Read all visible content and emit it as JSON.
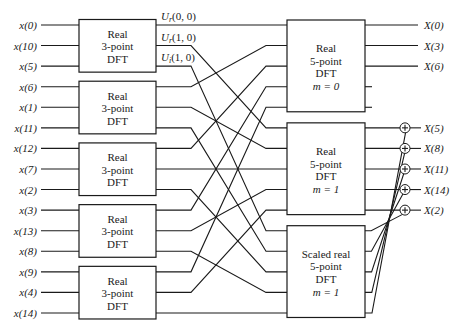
{
  "diagram": {
    "inputs": [
      "x(0)",
      "x(10)",
      "x(5)",
      "x(6)",
      "x(1)",
      "x(11)",
      "x(12)",
      "x(7)",
      "x(2)",
      "x(3)",
      "x(13)",
      "x(8)",
      "x(9)",
      "x(4)",
      "x(14)"
    ],
    "three_point_blocks": [
      {
        "lines": [
          "Real",
          "3-point",
          "DFT"
        ]
      },
      {
        "lines": [
          "Real",
          "3-point",
          "DFT"
        ]
      },
      {
        "lines": [
          "Real",
          "3-point",
          "DFT"
        ]
      },
      {
        "lines": [
          "Real",
          "3-point",
          "DFT"
        ]
      },
      {
        "lines": [
          "Real",
          "3-point",
          "DFT"
        ]
      }
    ],
    "intermediate_labels": [
      {
        "main": "U",
        "sub": "r",
        "args": "(0, 0)"
      },
      {
        "main": "U",
        "sub": "r",
        "args": "(1, 0)"
      },
      {
        "main": "U",
        "sub": "i",
        "args": "(1, 0)"
      }
    ],
    "five_point_blocks": [
      {
        "lines": [
          "Real",
          "5-point",
          "DFT",
          "m = 0"
        ]
      },
      {
        "lines": [
          "Real",
          "5-point",
          "DFT",
          "m = 1"
        ]
      },
      {
        "lines": [
          "Scaled real",
          "5-point",
          "DFT",
          "m = 1"
        ]
      }
    ],
    "outputs_block0": [
      "X(0)",
      "X(3)",
      "X(6)"
    ],
    "outputs_adders": [
      "X(5)",
      "X(8)",
      "X(11)",
      "X(14)",
      "X(2)"
    ],
    "adder_symbol": "+",
    "wiring_rule": "3-point block n output k feeds 5-point block k input n",
    "adder_rule": "scaled block output j feeds adder (4 - j)"
  }
}
